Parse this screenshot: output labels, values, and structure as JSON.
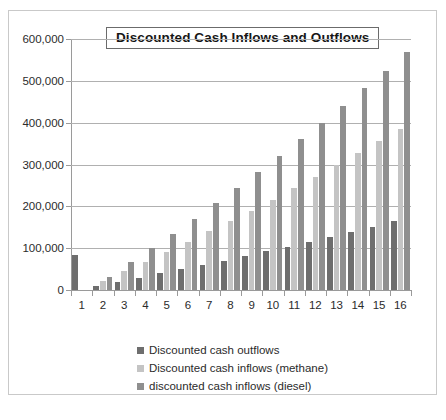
{
  "chart_data": {
    "type": "bar",
    "title": "Discounted Cash Inflows and Outflows",
    "xlabel": "",
    "ylabel": "",
    "ylim": [
      0,
      600000
    ],
    "ytick_step": 100000,
    "ytick_labels": [
      "0",
      "100,000",
      "200,000",
      "300,000",
      "400,000",
      "500,000",
      "600,000"
    ],
    "grid": true,
    "legend_position": "bottom",
    "categories": [
      "1",
      "2",
      "3",
      "4",
      "5",
      "6",
      "7",
      "8",
      "9",
      "10",
      "11",
      "12",
      "13",
      "14",
      "15",
      "16"
    ],
    "series": [
      {
        "name": "Discounted cash outflows",
        "color": "#6e6e6e",
        "values": [
          83000,
          10000,
          19000,
          29000,
          40000,
          50000,
          60000,
          70000,
          81000,
          93000,
          104000,
          115000,
          126000,
          139000,
          151000,
          164000
        ]
      },
      {
        "name": "Discounted cash inflows (methane)",
        "color": "#c4c4c4",
        "values": [
          0,
          22000,
          45000,
          67000,
          91000,
          115000,
          140000,
          165000,
          190000,
          216000,
          244000,
          270000,
          298000,
          327000,
          356000,
          386000
        ]
      },
      {
        "name": "discounted cash inflows (diesel)",
        "color": "#8f8f8f",
        "values": [
          0,
          32000,
          66000,
          100000,
          134000,
          170000,
          207000,
          244000,
          281000,
          320000,
          360000,
          400000,
          441000,
          482000,
          524000,
          568000
        ]
      }
    ]
  },
  "legend": {
    "items": [
      {
        "label": "Discounted cash outflows",
        "swatch": "outflow"
      },
      {
        "label": "Discounted cash inflows (methane)",
        "swatch": "methane"
      },
      {
        "label": "discounted cash inflows (diesel)",
        "swatch": "diesel"
      }
    ]
  }
}
